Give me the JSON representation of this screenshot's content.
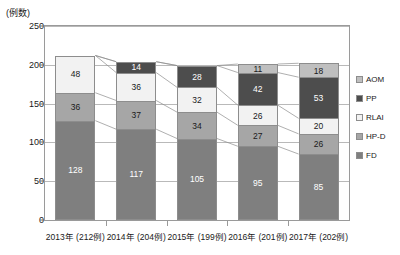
{
  "chart_data": {
    "type": "bar",
    "stacked": true,
    "title": "",
    "subtitle": "",
    "ylabel": "(例数)",
    "xlabel": "",
    "ylim": [
      0,
      250
    ],
    "yticks": [
      0,
      50,
      100,
      150,
      200,
      250
    ],
    "grid": true,
    "legend_position": "right",
    "categories": [
      "2013年 (212例)",
      "2014年 (204例)",
      "2015年 (199例)",
      "2016年 (201例)",
      "2017年 (202例)"
    ],
    "totals": [
      212,
      204,
      199,
      201,
      202
    ],
    "series": [
      {
        "name": "FD",
        "color": "#7f7f7f",
        "values": [
          128,
          117,
          105,
          95,
          85
        ]
      },
      {
        "name": "HP-D",
        "color": "#a6a6a6",
        "values": [
          36,
          37,
          34,
          27,
          26
        ]
      },
      {
        "name": "RLAI",
        "color": "#f2f2f2",
        "values": [
          48,
          36,
          32,
          26,
          20
        ]
      },
      {
        "name": "PP",
        "color": "#4d4d4d",
        "values": [
          0,
          14,
          28,
          42,
          53
        ]
      },
      {
        "name": "AOM",
        "color": "#bfbfbf",
        "values": [
          0,
          0,
          0,
          11,
          18
        ]
      }
    ],
    "legend": [
      {
        "label": "AOM",
        "color": "#bfbfbf"
      },
      {
        "label": "PP",
        "color": "#4d4d4d"
      },
      {
        "label": "RLAI",
        "color": "#f2f2f2"
      },
      {
        "label": "HP-D",
        "color": "#a6a6a6"
      },
      {
        "label": "FD",
        "color": "#7f7f7f"
      }
    ],
    "bar_labels": [
      [
        "128",
        "36",
        "48"
      ],
      [
        "117",
        "37",
        "36",
        "14"
      ],
      [
        "105",
        "34",
        "32",
        "28"
      ],
      [
        "95",
        "27",
        "26",
        "42",
        "11"
      ],
      [
        "85",
        "26",
        "20",
        "53",
        "18"
      ]
    ]
  }
}
